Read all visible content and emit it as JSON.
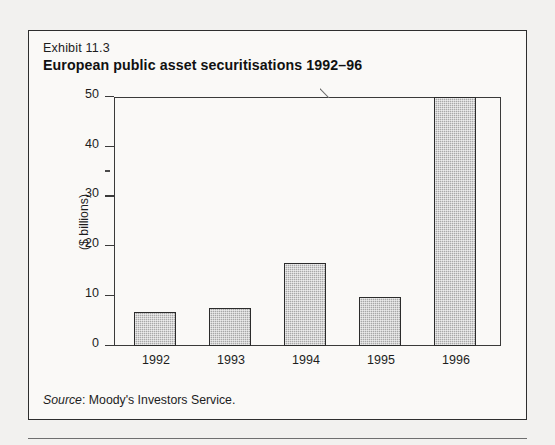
{
  "exhibit": {
    "label": "Exhibit 11.3",
    "title": "European public asset securitisations 1992–96",
    "source_prefix": "Source",
    "source_text": ": Moody's Investors Service."
  },
  "chart_data": {
    "type": "bar",
    "title": "European public asset securitisations 1992–96",
    "categories": [
      "1992",
      "1993",
      "1994",
      "1995",
      "1996"
    ],
    "values": [
      6.8,
      7.7,
      16.7,
      9.9,
      50.0
    ],
    "xlabel": "",
    "ylabel": "($ billions)",
    "ylim": [
      0,
      50
    ],
    "yticks": [
      0,
      10,
      20,
      30,
      40,
      50
    ],
    "ytick_labels": [
      "0",
      "10",
      "20",
      "30",
      "40",
      "50"
    ],
    "grid": false,
    "legend": "none",
    "bar_color": "#a8a8a8",
    "bar_edge_color": "#2b2b2b",
    "note": "1996 bar is truncated at the top of the axis"
  },
  "colors": {
    "page_background": "#f2f1ef",
    "panel_background": "#faf9f7",
    "border": "#2e2e2e",
    "axis": "#3a3a3a",
    "text": "#1d1d1d"
  }
}
